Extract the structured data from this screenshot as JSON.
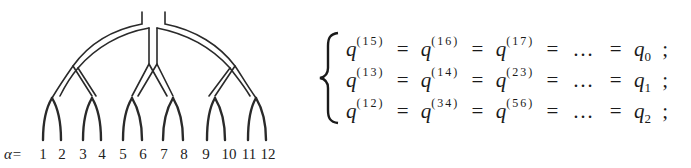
{
  "diagram": {
    "type": "ultrametric-tree",
    "leaf_axis_label": "α=",
    "leaves": [
      "1",
      "2",
      "3",
      "4",
      "5",
      "6",
      "7",
      "8",
      "9",
      "10",
      "11",
      "12"
    ],
    "levels": 3
  },
  "equations": {
    "rows": [
      {
        "terms": [
          {
            "symbol": "q",
            "sup": "(15)"
          },
          {
            "symbol": "q",
            "sup": "(16)"
          },
          {
            "symbol": "q",
            "sup": "(17)"
          }
        ],
        "ellipsis": "…",
        "result_symbol": "q",
        "result_sub": "0",
        "end": ";"
      },
      {
        "terms": [
          {
            "symbol": "q",
            "sup": "(13)"
          },
          {
            "symbol": "q",
            "sup": "(14)"
          },
          {
            "symbol": "q",
            "sup": "(23)"
          }
        ],
        "ellipsis": "…",
        "result_symbol": "q",
        "result_sub": "1",
        "end": ";"
      },
      {
        "terms": [
          {
            "symbol": "q",
            "sup": "(12)"
          },
          {
            "symbol": "q",
            "sup": "(34)"
          },
          {
            "symbol": "q",
            "sup": "(56)"
          }
        ],
        "ellipsis": "…",
        "result_symbol": "q",
        "result_sub": "2",
        "end": ";"
      }
    ],
    "equals": "="
  }
}
